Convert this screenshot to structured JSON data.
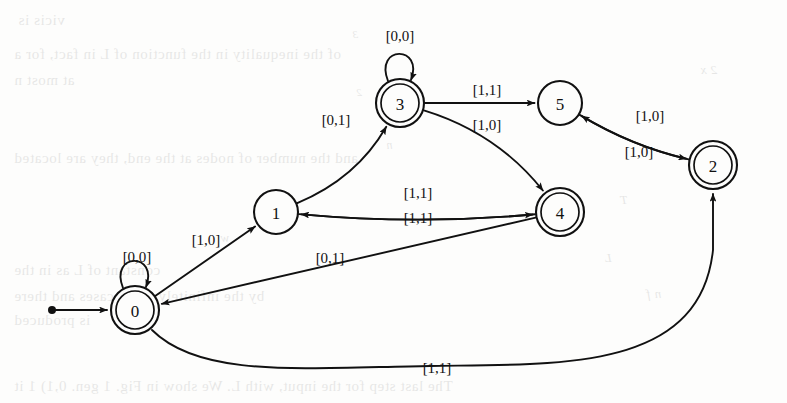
{
  "page": {
    "kind": "scanned-textbook-page-with-automaton-figure",
    "background_color": "#fdfdfc",
    "ink_color": "#111111"
  },
  "diagram": {
    "type": "finite-state-automaton",
    "start_marker": "filled-dot-with-arrow",
    "nodes": [
      {
        "id": "0",
        "label": "0",
        "cx": 135,
        "cy": 310,
        "r": 24,
        "accepting": true,
        "start": true
      },
      {
        "id": "1",
        "label": "1",
        "cx": 276,
        "cy": 212,
        "r": 22,
        "accepting": false,
        "start": false
      },
      {
        "id": "3",
        "label": "3",
        "cx": 400,
        "cy": 103,
        "r": 24,
        "accepting": true,
        "start": false
      },
      {
        "id": "5",
        "label": "5",
        "cx": 560,
        "cy": 103,
        "r": 22,
        "accepting": false,
        "start": false
      },
      {
        "id": "2",
        "label": "2",
        "cx": 713,
        "cy": 165,
        "r": 24,
        "accepting": true,
        "start": false
      },
      {
        "id": "4",
        "label": "4",
        "cx": 560,
        "cy": 212,
        "r": 24,
        "accepting": true,
        "start": false
      }
    ],
    "edges": [
      {
        "from": "0",
        "to": "0",
        "label": "[0,0]",
        "kind": "self-loop",
        "label_x": 137,
        "label_y": 257
      },
      {
        "from": "3",
        "to": "3",
        "label": "[0,0]",
        "kind": "self-loop",
        "label_x": 400,
        "label_y": 36
      },
      {
        "from": "0",
        "to": "1",
        "label": "[1,0]",
        "kind": "straight",
        "label_x": 206,
        "label_y": 240
      },
      {
        "from": "1",
        "to": "3",
        "label": "[0,1]",
        "kind": "curve",
        "label_x": 336,
        "label_y": 120
      },
      {
        "from": "3",
        "to": "5",
        "label": "[1,1]",
        "kind": "straight",
        "label_x": 487,
        "label_y": 90
      },
      {
        "from": "3",
        "to": "4",
        "label": "[1,0]",
        "kind": "curve",
        "label_x": 487,
        "label_y": 125
      },
      {
        "from": "4",
        "to": "1",
        "label": "[1,1]",
        "kind": "curve",
        "label_x": 418,
        "label_y": 193
      },
      {
        "from": "1",
        "to": "4",
        "label": "[1,1]",
        "kind": "curve",
        "label_x": 418,
        "label_y": 218
      },
      {
        "from": "4",
        "to": "0",
        "label": "[0,1]",
        "kind": "straight",
        "label_x": 330,
        "label_y": 258
      },
      {
        "from": "2",
        "to": "5",
        "label": "[1,0]",
        "kind": "curve",
        "label_x": 650,
        "label_y": 116
      },
      {
        "from": "5",
        "to": "2",
        "label": "[1,0]",
        "kind": "curve",
        "label_x": 639,
        "label_y": 152
      },
      {
        "from": "0",
        "to": "2",
        "label": "[1,1]",
        "kind": "long-curve",
        "label_x": 437,
        "label_y": 368
      }
    ]
  },
  "bleed_text": {
    "note": "faint mirrored show-through text from the reverse side of the scanned sheet",
    "lines": [
      {
        "text": "vicis is",
        "x": 18,
        "y": 12,
        "size": 15,
        "italic": false
      },
      {
        "text": "of the inequality in the function of L in fact, for a",
        "x": 14,
        "y": 46,
        "size": 15,
        "italic": false
      },
      {
        "text": "at most n",
        "x": 14,
        "y": 72,
        "size": 15,
        "italic": false
      },
      {
        "text": "and the number of nodes at the end, they are located",
        "x": 14,
        "y": 150,
        "size": 15,
        "italic": false
      },
      {
        "text": "w",
        "x": 220,
        "y": 230,
        "size": 13,
        "italic": true
      },
      {
        "text": "constant of L as in the",
        "x": 14,
        "y": 262,
        "size": 15,
        "italic": false
      },
      {
        "text": "by the infinitely many cases and there",
        "x": 14,
        "y": 288,
        "size": 15,
        "italic": false
      },
      {
        "text": "is produced",
        "x": 14,
        "y": 312,
        "size": 15,
        "italic": false
      },
      {
        "text": "The last step for the input, with L. We show in Fig. 1 gen. 0,1) 1 it",
        "x": 14,
        "y": 378,
        "size": 15,
        "italic": false
      },
      {
        "text": "3",
        "x": 352,
        "y": 28,
        "size": 11,
        "italic": true
      },
      {
        "text": "n",
        "x": 386,
        "y": 138,
        "size": 12,
        "italic": true
      },
      {
        "text": "2",
        "x": 356,
        "y": 86,
        "size": 11,
        "italic": true
      },
      {
        "text": "T",
        "x": 620,
        "y": 192,
        "size": 13,
        "italic": true
      },
      {
        "text": "L",
        "x": 604,
        "y": 250,
        "size": 13,
        "italic": true
      },
      {
        "text": "n f",
        "x": 646,
        "y": 286,
        "size": 13,
        "italic": true
      },
      {
        "text": "2 x",
        "x": 700,
        "y": 62,
        "size": 13,
        "italic": true
      }
    ]
  }
}
